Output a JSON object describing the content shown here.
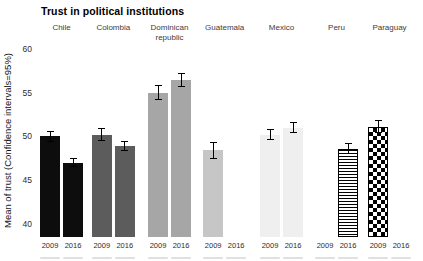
{
  "chart_data": {
    "type": "bar",
    "title": "Trust in political institutions",
    "ylabel": "Mean of trust (Confidence intervals=95%)",
    "xlabel": "",
    "ylim": [
      38.5,
      61
    ],
    "yticks": [
      40,
      45,
      50,
      55,
      60
    ],
    "grid": false,
    "legend_position": "none",
    "error_bars": "95% confidence intervals",
    "years": [
      "2009",
      "2016"
    ],
    "groups": [
      {
        "country": "Chile",
        "pattern": "solid",
        "color": "#0d0d0d",
        "bars": [
          {
            "year": "2009",
            "mean": 50.0,
            "ci": [
              49.4,
              50.6
            ]
          },
          {
            "year": "2016",
            "mean": 47.0,
            "ci": [
              46.5,
              47.5
            ]
          }
        ]
      },
      {
        "country": "Colombia",
        "pattern": "solid",
        "color": "#5c5c5c",
        "bars": [
          {
            "year": "2009",
            "mean": 50.2,
            "ci": [
              49.5,
              50.9
            ]
          },
          {
            "year": "2016",
            "mean": 48.9,
            "ci": [
              48.3,
              49.5
            ]
          }
        ]
      },
      {
        "country": "Dominican republic",
        "pattern": "solid",
        "color": "#a6a6a6",
        "bars": [
          {
            "year": "2009",
            "mean": 55.0,
            "ci": [
              54.1,
              55.9
            ]
          },
          {
            "year": "2016",
            "mean": 56.4,
            "ci": [
              55.6,
              57.2
            ]
          }
        ]
      },
      {
        "country": "Guatemala",
        "pattern": "solid",
        "color": "#c6c6c6",
        "bars": [
          {
            "year": "2009",
            "mean": 48.4,
            "ci": [
              47.4,
              49.3
            ]
          },
          {
            "year": "2016",
            "mean": null,
            "ci": null
          }
        ]
      },
      {
        "country": "Mexico",
        "pattern": "solid",
        "color": "#efefef",
        "bars": [
          {
            "year": "2009",
            "mean": 50.2,
            "ci": [
              49.6,
              50.8
            ]
          },
          {
            "year": "2016",
            "mean": 51.0,
            "ci": [
              50.4,
              51.6
            ]
          }
        ]
      },
      {
        "country": "Peru",
        "pattern": "stripes-horizontal",
        "color": "#000000",
        "bars": [
          {
            "year": "2009",
            "mean": null,
            "ci": null
          },
          {
            "year": "2016",
            "mean": 48.6,
            "ci": [
              48.0,
              49.2
            ]
          }
        ]
      },
      {
        "country": "Paraguay",
        "pattern": "checkerboard",
        "color": "#000000",
        "bars": [
          {
            "year": "2009",
            "mean": 51.1,
            "ci": [
              50.4,
              51.9
            ]
          },
          {
            "year": "2016",
            "mean": null,
            "ci": null
          }
        ]
      }
    ]
  }
}
